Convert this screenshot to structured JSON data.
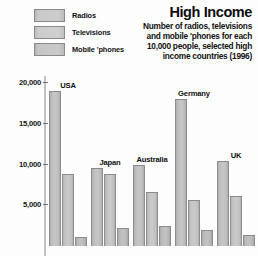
{
  "header": {
    "title": "High Income",
    "subtitle_lines": [
      "Number of radios, televisions",
      "and mobile 'phones for each",
      "10,000 people, selected high",
      "income countries (1996)"
    ],
    "legend": [
      {
        "label": "Radios",
        "swatch": "legend-swatch-radios"
      },
      {
        "label": "Televisions",
        "swatch": "legend-swatch-televisions"
      },
      {
        "label": "Mobile 'phones",
        "swatch": "legend-swatch-mobile-phones"
      }
    ]
  },
  "axis": {
    "ticks": [
      {
        "label": "20,000",
        "value": 20000
      },
      {
        "label": "15,000",
        "value": 15000
      },
      {
        "label": "10,000",
        "value": 10000
      },
      {
        "label": "5,000",
        "value": 5000
      }
    ]
  },
  "chart_data": {
    "type": "bar",
    "title": "High Income",
    "subtitle": "Number of radios, televisions and mobile 'phones for each 10,000 people, selected high income countries (1996)",
    "xlabel": "",
    "ylabel": "",
    "ylim": [
      0,
      21500
    ],
    "grid": false,
    "legend_position": "top-left",
    "categories": [
      "USA",
      "Japan",
      "Australia",
      "Germany",
      "UK"
    ],
    "series": [
      {
        "name": "Radios",
        "values": [
          19000,
          9600,
          10000,
          18100,
          10500
        ]
      },
      {
        "name": "Televisions",
        "values": [
          8800,
          8800,
          6600,
          5700,
          6100
        ]
      },
      {
        "name": "Mobile 'phones",
        "values": [
          1100,
          2200,
          2500,
          2000,
          1300
        ]
      }
    ],
    "tick_labels": [
      "5,000",
      "10,000",
      "15,000",
      "20,000"
    ]
  }
}
